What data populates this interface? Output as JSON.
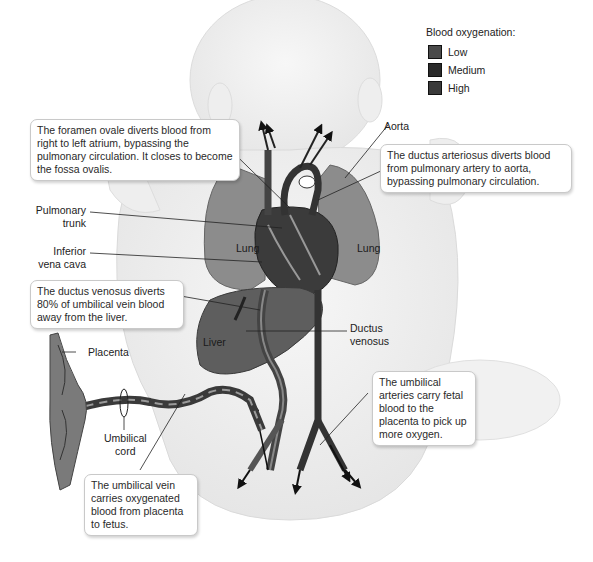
{
  "legend": {
    "title": "Blood oxygenation:",
    "items": [
      {
        "label": "Low",
        "color": "#4a4a4a"
      },
      {
        "label": "Medium",
        "color": "#2a2a2a"
      },
      {
        "label": "High",
        "color": "#3a3a3a"
      }
    ]
  },
  "callouts": {
    "foramen_ovale": "The foramen ovale diverts blood from right to left atrium, bypassing the pulmonary circulation. It closes to become the fossa ovalis.",
    "ductus_arteriosus": "The ductus arteriosus diverts blood from pulmonary artery to aorta, bypassing pulmonary circulation.",
    "ductus_venosus": "The ductus venosus diverts 80% of umbilical vein blood away from the liver.",
    "umbilical_arteries": "The umbilical arteries carry fetal blood to the placenta to pick up more oxygen.",
    "umbilical_vein": "The umbilical vein carries oxygenated blood from placenta to fetus."
  },
  "labels": {
    "aorta": "Aorta",
    "pulmonary_trunk_1": "Pulmonary",
    "pulmonary_trunk_2": "trunk",
    "ivc_1": "Inferior",
    "ivc_2": "vena cava",
    "ductus_venosus_1": "Ductus",
    "ductus_venosus_2": "venosus",
    "placenta": "Placenta",
    "umbilical_cord_1": "Umbilical",
    "umbilical_cord_2": "cord",
    "lung_left": "Lung",
    "lung_right": "Lung",
    "liver": "Liver"
  },
  "colors": {
    "body_outline": "#d8d8d8",
    "body_fill": "#f2f2f2",
    "lung": "#8c8c8c",
    "heart": "#3b3b3b",
    "liver": "#5e5e5e",
    "vessel_dark": "#333333",
    "vessel_mid": "#6a6a6a",
    "placenta": "#7a7a7a"
  }
}
